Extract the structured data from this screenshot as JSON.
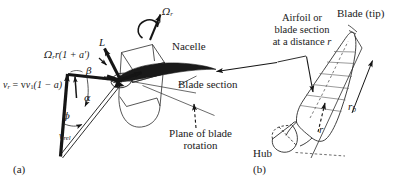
{
  "figure": {
    "type": "technical-diagram",
    "panels": [
      {
        "id": "a",
        "label": "(a)",
        "title": "Blade section velocity and force diagram"
      },
      {
        "id": "b",
        "label": "(b)",
        "title": "Blade and hub geometry"
      }
    ]
  },
  "panel_a": {
    "caption": "(a)",
    "labels": {
      "omega_r": "Ω",
      "omega_r_sub": "r",
      "nacelle": "Nacelle",
      "lift": "L",
      "drag": "D",
      "blade_section": "Blade section",
      "plane_of_rotation_line1": "Plane of blade",
      "plane_of_rotation_line2": "rotation",
      "tangential_velocity": "Ω",
      "tangential_velocity_sub": "r",
      "tangential_velocity_rest": "r(1 + a′)",
      "axial_velocity_v": "v",
      "axial_velocity_sub_r": "r",
      "axial_velocity_eq": " = v",
      "axial_velocity_sub_1": "1",
      "axial_velocity_rest": "(1 − a)",
      "relative_velocity": "v",
      "relative_velocity_sub": "rel",
      "angle_alpha": "α",
      "angle_beta": "β",
      "angle_phi": "ϕ"
    }
  },
  "panel_b": {
    "caption": "(b)",
    "labels": {
      "blade_tip": "Blade (tip)",
      "airfoil_line1": "Airfoil or",
      "airfoil_line2": "blade section",
      "airfoil_line3_pre": "at a distance ",
      "airfoil_line3_var": "r",
      "hub": "Hub",
      "radius_r": "r",
      "radius_blade": "r",
      "radius_blade_sub": "b"
    }
  },
  "style": {
    "ink": "#1a1a1a",
    "thin": "#2b2b2b",
    "background": "#ffffff"
  }
}
